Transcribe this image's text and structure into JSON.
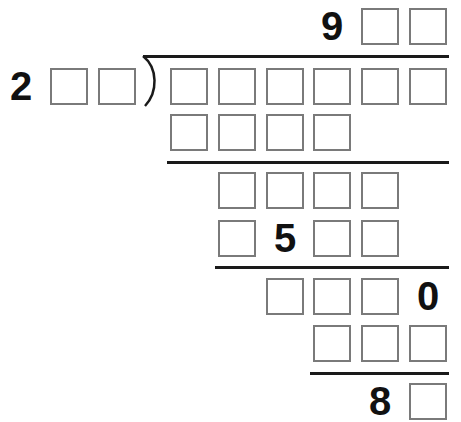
{
  "puzzle": {
    "type": "long-division-cryptarithm",
    "quotient": {
      "cells": [
        "9",
        "",
        ""
      ]
    },
    "divisor": {
      "cells": [
        "2",
        "",
        ""
      ]
    },
    "dividend": {
      "cells": [
        "",
        "",
        "",
        "",
        "",
        ""
      ]
    },
    "steps": [
      {
        "cells": [
          "",
          "",
          "",
          ""
        ]
      },
      {
        "cells": [
          "",
          "",
          "",
          ""
        ]
      },
      {
        "cells": [
          "",
          "5",
          "",
          ""
        ]
      },
      {
        "cells": [
          "",
          "",
          "",
          "0"
        ]
      },
      {
        "cells": [
          "",
          "",
          ""
        ]
      }
    ],
    "remainder": {
      "cells": [
        "8",
        ""
      ]
    }
  },
  "colors": {
    "box_border": "#7a7a7a",
    "digit": "#111111",
    "rule": "#1a1a1a",
    "background": "#ffffff"
  }
}
